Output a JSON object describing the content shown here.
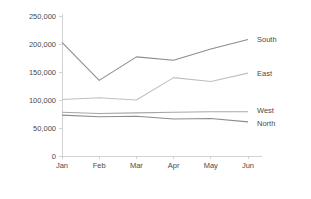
{
  "chart_data": {
    "type": "line",
    "title": "",
    "subtitle": "",
    "xlabel": "",
    "ylabel": "",
    "categories": [
      "Jan",
      "Feb",
      "Mar",
      "Apr",
      "May",
      "Jun"
    ],
    "x_tick_labels": [
      "Jan",
      "Feb",
      "Mar",
      "Apr",
      "May",
      "Jun"
    ],
    "y_tick_labels": [
      "0",
      "50,000",
      "100,000",
      "150,000",
      "200,000",
      "250,000"
    ],
    "y_tick_values": [
      0,
      50000,
      100000,
      150000,
      200000,
      250000
    ],
    "ylim": [
      0,
      250000
    ],
    "grid": false,
    "legend_position": "right-inline-end-of-line",
    "series": [
      {
        "name": "South",
        "color": "#8c8c8c",
        "values": [
          203000,
          135000,
          177000,
          171000,
          191000,
          208000
        ]
      },
      {
        "name": "East",
        "color": "#bfbfbf",
        "values": [
          101000,
          104000,
          100000,
          140000,
          133000,
          148000
        ]
      },
      {
        "name": "West",
        "color": "#a6a6a6",
        "values": [
          78000,
          76000,
          77000,
          78000,
          79000,
          79000
        ]
      },
      {
        "name": "North",
        "color": "#8c8c8c",
        "values": [
          73000,
          70000,
          71000,
          66000,
          67000,
          61000
        ]
      }
    ]
  },
  "axes": {
    "axis_color": "#c8c8c8",
    "background": "#ffffff",
    "text_color": "#4a4a4a"
  }
}
